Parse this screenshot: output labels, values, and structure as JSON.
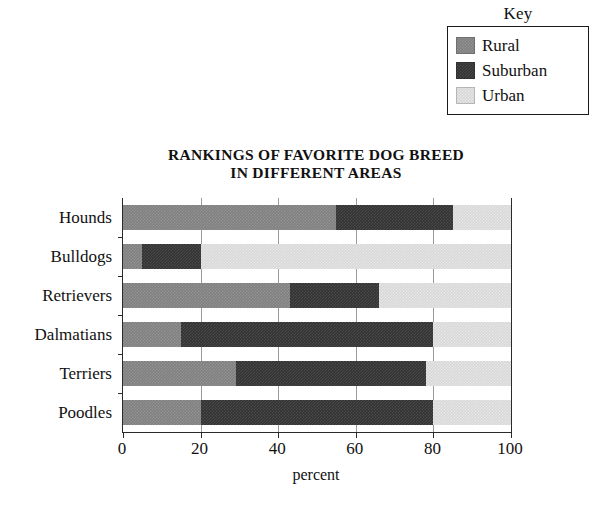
{
  "legend": {
    "title": "Key",
    "items": [
      {
        "label": "Rural",
        "color": "#808080"
      },
      {
        "label": "Suburban",
        "color": "#333333"
      },
      {
        "label": "Urban",
        "color": "#d8d8d8"
      }
    ]
  },
  "chart": {
    "title_line1": "RANKINGS OF FAVORITE DOG BREED",
    "title_line2": "IN DIFFERENT AREAS"
  },
  "chart_data": {
    "type": "bar",
    "orientation": "horizontal",
    "stacked": true,
    "percent_stacked": true,
    "title": "RANKINGS OF FAVORITE DOG BREED IN DIFFERENT AREAS",
    "xlabel": "percent",
    "ylabel": "",
    "xlim": [
      0,
      100
    ],
    "xticks": [
      0,
      20,
      40,
      60,
      80,
      100
    ],
    "xtick_labels": [
      "0",
      "20",
      "40",
      "60",
      "80",
      "100"
    ],
    "grid": true,
    "grid_axis": "x",
    "legend_title": "Key",
    "legend_position": "top-right",
    "categories": [
      "Hounds",
      "Bulldogs",
      "Retrievers",
      "Dalmatians",
      "Terriers",
      "Poodles"
    ],
    "series": [
      {
        "name": "Rural",
        "color": "#808080",
        "values": [
          55,
          5,
          43,
          15,
          29,
          20
        ]
      },
      {
        "name": "Suburban",
        "color": "#333333",
        "values": [
          30,
          15,
          23,
          65,
          49,
          60
        ]
      },
      {
        "name": "Urban",
        "color": "#d8d8d8",
        "values": [
          15,
          80,
          34,
          20,
          22,
          20
        ]
      }
    ],
    "cumulative_boundaries": {
      "Hounds": [
        55,
        85,
        100
      ],
      "Bulldogs": [
        5,
        20,
        100
      ],
      "Retrievers": [
        43,
        66,
        100
      ],
      "Dalmatians": [
        15,
        80,
        100
      ],
      "Terriers": [
        29,
        78,
        100
      ],
      "Poodles": [
        20,
        80,
        100
      ]
    }
  }
}
